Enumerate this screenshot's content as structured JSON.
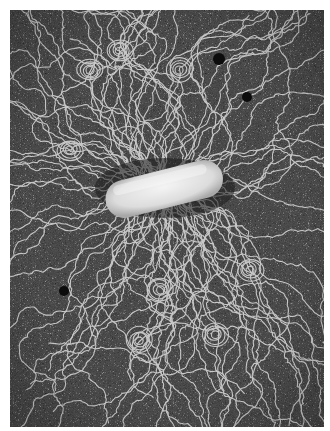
{
  "image": {
    "description": "Electron micrograph of a rod-shaped bacterium with DNA strands spread out around it",
    "subject": "bacterium",
    "colors": {
      "background": "#4a4a4a",
      "noise_light": "#9a9a9a",
      "noise_dark": "#2a2a2a",
      "strand": "#d8d8d8",
      "cell": "#e6e6e6",
      "border": "#ffffff"
    },
    "features": [
      {
        "name": "bacterium-cell",
        "center": [
          164,
          185
        ],
        "length": 120,
        "thickness": 42
      },
      {
        "name": "dark-particle",
        "center": [
          219,
          59
        ],
        "radius": 6
      },
      {
        "name": "dark-particle",
        "center": [
          247,
          97
        ],
        "radius": 5
      },
      {
        "name": "dark-particle",
        "center": [
          64,
          291
        ],
        "radius": 5
      }
    ]
  }
}
